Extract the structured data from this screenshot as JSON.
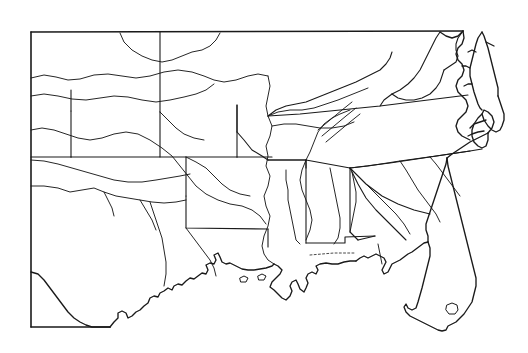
{
  "document": {
    "type": "outline-map",
    "title": "Southeastern United States Outline Map",
    "style": "black line art on white background",
    "background_color": "#ffffff",
    "ink_color": "#1a1a1a",
    "canvas": {
      "width": 528,
      "height": 353
    }
  },
  "frame": {
    "name": "map-neatline",
    "left": 31,
    "top": 32,
    "right": 465,
    "bottom": 327,
    "note": "rectangular border; right and bottom edges are interrupted where the coastline replaces them"
  },
  "map_content": {
    "region": "Southeastern United States and adjacent Great Plains",
    "features_shown": [
      "state boundaries",
      "major rivers",
      "Atlantic and Gulf of Mexico coastlines",
      "Chesapeake Bay and Delmarva Peninsula",
      "Outer Banks barrier islands",
      "Mississippi River delta",
      "Florida peninsula and Lake Okeechobee"
    ],
    "states_depicted": [
      "Kansas",
      "Missouri",
      "Oklahoma",
      "Arkansas",
      "Texas",
      "Louisiana",
      "Mississippi",
      "Alabama",
      "Tennessee",
      "Kentucky",
      "Virginia",
      "North Carolina",
      "South Carolina",
      "Georgia",
      "Florida",
      "Maryland",
      "West Virginia"
    ],
    "rivers_depicted": [
      "Mississippi River",
      "Missouri River",
      "Arkansas River",
      "Red River",
      "Canadian River",
      "Ohio River",
      "Tennessee River",
      "Sabine River",
      "Rio Grande headwaters region",
      "Alabama River",
      "Savannah River"
    ],
    "water_bodies": [
      "Gulf of Mexico",
      "Atlantic Ocean",
      "Chesapeake Bay",
      "Lake Okeechobee",
      "Pamlico Sound",
      "Albemarle Sound"
    ]
  },
  "labels": {
    "present": false,
    "note": "the map carries no text, legend, scale bar, north arrow or tick labels"
  }
}
